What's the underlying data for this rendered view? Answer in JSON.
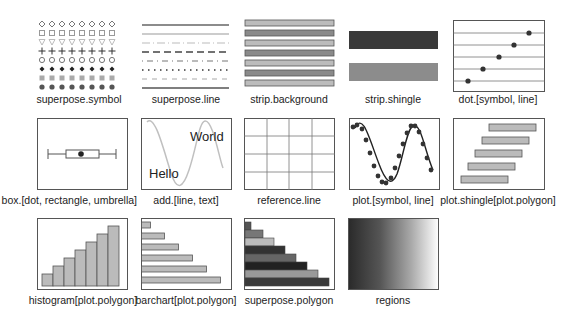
{
  "figure": {
    "title": "",
    "panels": [
      {
        "id": "superpose-symbol",
        "label": "superpose.symbol"
      },
      {
        "id": "superpose-line",
        "label": "superpose.line"
      },
      {
        "id": "strip-background",
        "label": "strip.background"
      },
      {
        "id": "strip-shingle",
        "label": "strip.shingle"
      },
      {
        "id": "dot-symbol-line",
        "label": "dot.[symbol, line]"
      },
      {
        "id": "box-dot-rectangle-umbrella",
        "label": "box.[dot, rectangle, umbrella]"
      },
      {
        "id": "add-line-text",
        "label": "add.[line, text]",
        "texts": [
          "World",
          "Hello"
        ]
      },
      {
        "id": "reference-line",
        "label": "reference.line"
      },
      {
        "id": "plot-symbol-line",
        "label": "plot.[symbol, line]"
      },
      {
        "id": "plot-shingle-polygon",
        "label": "plot.shingle[plot.polygon]"
      },
      {
        "id": "histogram-polygon",
        "label": "histogram[plot.polygon]"
      },
      {
        "id": "barchart-polygon",
        "label": "barchart[plot.polygon]"
      },
      {
        "id": "superpose-polygon",
        "label": "superpose.polygon"
      },
      {
        "id": "regions",
        "label": "regions"
      }
    ]
  },
  "colors": {
    "frame": "#555555",
    "light_gray": "#bbbbbb",
    "mid_gray": "#888888",
    "dark_gray": "#333333",
    "strip_dark": "#3a3a3a",
    "strip_light": "#8c8c8c",
    "gradient_start": "#2a2a2a",
    "gradient_end": "#ffffff"
  },
  "chart_data": [
    {
      "type": "scatter",
      "title": "dot.[symbol, line]",
      "x": [
        1,
        2,
        3,
        4,
        5
      ],
      "y": [
        1,
        2,
        3,
        4,
        5
      ]
    },
    {
      "type": "bar",
      "title": "histogram[plot.polygon]",
      "categories": [
        "1",
        "2",
        "3",
        "4",
        "5",
        "6",
        "7"
      ],
      "values": [
        1,
        2,
        3,
        4,
        5,
        6,
        7
      ]
    },
    {
      "type": "bar",
      "title": "barchart[plot.polygon]",
      "orientation": "horizontal",
      "categories": [
        "1",
        "2",
        "3",
        "4",
        "5",
        "6"
      ],
      "values": [
        1,
        2,
        3,
        4,
        5,
        6
      ]
    },
    {
      "type": "bar",
      "title": "superpose.polygon",
      "orientation": "horizontal",
      "categories": [
        "1",
        "2",
        "3",
        "4",
        "5",
        "6",
        "7",
        "8"
      ],
      "values": [
        1,
        2,
        3,
        4,
        5,
        6,
        7,
        8
      ]
    }
  ]
}
